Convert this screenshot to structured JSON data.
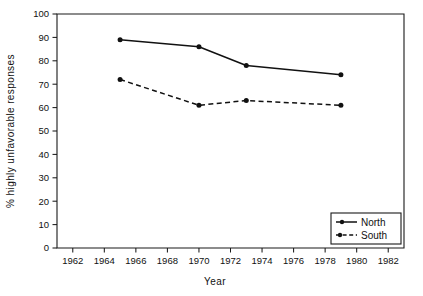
{
  "chart_data": {
    "type": "line",
    "title": "",
    "xlabel": "Year",
    "ylabel": "% highly unfavorable responses",
    "xlim": [
      1961,
      1983
    ],
    "ylim": [
      0,
      100
    ],
    "grid": false,
    "legend_position": "bottom-right",
    "x_ticks": [
      1962,
      1964,
      1966,
      1968,
      1970,
      1972,
      1974,
      1976,
      1978,
      1980,
      1982
    ],
    "x_tick_labels": [
      "1962",
      "1964",
      "1966",
      "1968",
      "1970",
      "1972",
      "1974",
      "1976",
      "1978",
      "1980",
      "1982"
    ],
    "y_ticks": [
      0,
      10,
      20,
      30,
      40,
      50,
      60,
      70,
      80,
      90,
      100
    ],
    "y_tick_labels": [
      "0",
      "10",
      "20",
      "30",
      "40",
      "50",
      "60",
      "70",
      "80",
      "90",
      "100"
    ],
    "x": [
      1965,
      1970,
      1973,
      1979
    ],
    "series": [
      {
        "name": "North",
        "style": "solid",
        "marker": "filled-circle",
        "values": [
          89,
          86,
          78,
          74
        ]
      },
      {
        "name": "South",
        "style": "dashed",
        "marker": "filled-circle",
        "values": [
          72,
          61,
          63,
          61
        ]
      }
    ]
  },
  "legend": {
    "entries": [
      {
        "label": "North",
        "style": "solid"
      },
      {
        "label": "South",
        "style": "dashed"
      }
    ]
  },
  "axes": {
    "x_axis_title": "Year",
    "y_axis_title": "% highly unfavorable responses"
  }
}
